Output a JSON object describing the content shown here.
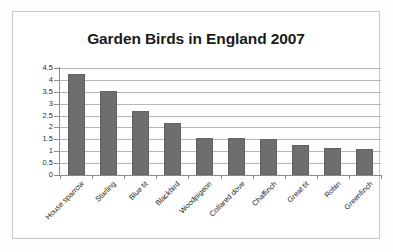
{
  "chart_data": {
    "type": "bar",
    "title": "Garden Birds in England 2007",
    "xlabel": "",
    "ylabel": "",
    "ylim": [
      0,
      4.5
    ],
    "ytick_labels": [
      "0",
      "0.5",
      "1",
      "1.5",
      "2",
      "2.5",
      "3",
      "3.5",
      "4",
      "4.5"
    ],
    "ytick_values": [
      0,
      0.5,
      1,
      1.5,
      2,
      2.5,
      3,
      3.5,
      4,
      4.5
    ],
    "grid": true,
    "legend": false,
    "bar_color": "#6e6e6e",
    "categories": [
      "House sparrow",
      "Starling",
      "Blue tit",
      "Blackbird",
      "Woodpigeon",
      "Collared dove",
      "Chaffinch",
      "Great tit",
      "Robin",
      "Greenfinch"
    ],
    "values": [
      4.25,
      3.55,
      2.7,
      2.2,
      1.55,
      1.55,
      1.5,
      1.25,
      1.15,
      1.1
    ]
  }
}
